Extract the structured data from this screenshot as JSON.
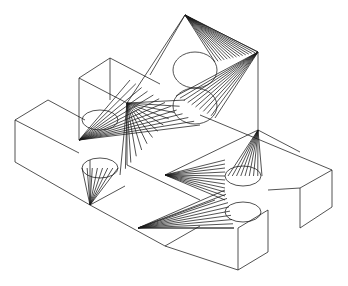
{
  "figure": {
    "stroke_color": "#1a1a1a",
    "background": "#ffffff",
    "edges": [
      [
        185,
        15,
        258,
        52
      ],
      [
        258,
        52,
        258,
        130
      ],
      [
        185,
        15,
        150,
        75
      ],
      [
        185,
        15,
        127,
        103
      ],
      [
        110,
        58,
        79,
        78
      ],
      [
        110,
        58,
        160,
        84
      ],
      [
        79,
        78,
        79,
        140
      ],
      [
        79,
        78,
        127,
        103
      ],
      [
        127,
        103,
        127,
        165
      ],
      [
        110,
        58,
        110,
        100
      ],
      [
        48,
        100,
        15,
        120
      ],
      [
        48,
        100,
        85,
        120
      ],
      [
        15,
        120,
        15,
        162
      ],
      [
        15,
        120,
        79,
        153
      ],
      [
        15,
        162,
        90,
        205
      ],
      [
        90,
        205,
        125,
        186
      ],
      [
        90,
        205,
        90,
        160
      ],
      [
        90,
        205,
        165,
        246
      ],
      [
        165,
        246,
        200,
        226
      ],
      [
        200,
        115,
        332,
        170
      ],
      [
        332,
        170,
        332,
        207
      ],
      [
        332,
        170,
        300,
        188
      ],
      [
        300,
        188,
        300,
        228
      ],
      [
        300,
        228,
        332,
        207
      ],
      [
        258,
        130,
        300,
        152
      ],
      [
        268,
        190,
        300,
        188
      ],
      [
        238,
        228,
        268,
        210
      ],
      [
        268,
        210,
        268,
        252
      ],
      [
        238,
        228,
        238,
        270
      ],
      [
        238,
        270,
        268,
        252
      ],
      [
        165,
        246,
        238,
        270
      ],
      [
        138,
        228,
        234,
        228
      ],
      [
        138,
        228,
        215,
        200
      ],
      [
        258,
        130,
        165,
        175
      ],
      [
        127,
        165,
        200,
        200
      ]
    ],
    "ellipses": [
      [
        195,
        70,
        22,
        18
      ],
      [
        195,
        106,
        22,
        18
      ],
      [
        100,
        120,
        18,
        10
      ],
      [
        100,
        168,
        18,
        10
      ],
      [
        243,
        176,
        18,
        10
      ],
      [
        243,
        212,
        18,
        10
      ]
    ],
    "fans": [
      {
        "apex": [
          185,
          15
        ],
        "from": [
          215,
          62
        ],
        "to": [
          258,
          52
        ],
        "count": 14
      },
      {
        "apex": [
          258,
          52
        ],
        "from": [
          176,
          96
        ],
        "to": [
          215,
          118
        ],
        "count": 10
      },
      {
        "apex": [
          165,
          175
        ],
        "from": [
          225,
          160
        ],
        "to": [
          225,
          200
        ],
        "count": 10
      },
      {
        "apex": [
          138,
          228
        ],
        "from": [
          225,
          190
        ],
        "to": [
          234,
          228
        ],
        "count": 9
      },
      {
        "apex": [
          258,
          130
        ],
        "from": [
          228,
          176
        ],
        "to": [
          262,
          176
        ],
        "count": 8
      },
      {
        "apex": [
          90,
          205
        ],
        "from": [
          82,
          168
        ],
        "to": [
          118,
          168
        ],
        "count": 7
      },
      {
        "apex": [
          127,
          103
        ],
        "from": [
          120,
          175
        ],
        "to": [
          185,
          100
        ],
        "count": 12
      },
      {
        "apex": [
          79,
          140
        ],
        "from": [
          130,
          80
        ],
        "to": [
          200,
          125
        ],
        "count": 12
      }
    ]
  }
}
